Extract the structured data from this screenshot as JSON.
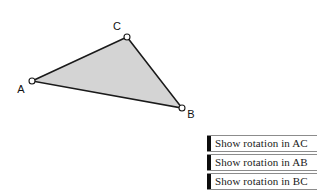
{
  "figure": {
    "name": "shaded-triangle",
    "fill_color": "#d4d4d4",
    "stroke_color": "#1a1a1a",
    "vertex_marker_fill": "#ffffff",
    "vertices": [
      {
        "id": "A",
        "label": "A",
        "x": 32,
        "y": 81,
        "label_x": 21,
        "label_y": 93
      },
      {
        "id": "B",
        "label": "B",
        "x": 182,
        "y": 108,
        "label_x": 189,
        "label_y": 118
      },
      {
        "id": "C",
        "label": "C",
        "x": 127,
        "y": 37,
        "label_x": 117,
        "label_y": 30
      }
    ],
    "edges": [
      "AC",
      "CB",
      "BA"
    ]
  },
  "buttons": [
    {
      "label": "Show rotation in AC",
      "name": "show-rotation-ac-button"
    },
    {
      "label": "Show rotation in AB",
      "name": "show-rotation-ab-button"
    },
    {
      "label": "Show rotation in BC",
      "name": "show-rotation-bc-button"
    }
  ],
  "colors": {
    "background": "#ffffff",
    "button_border": "#8c8c8c",
    "button_grip": "#0d0d0d",
    "text": "#1a1a1a"
  }
}
